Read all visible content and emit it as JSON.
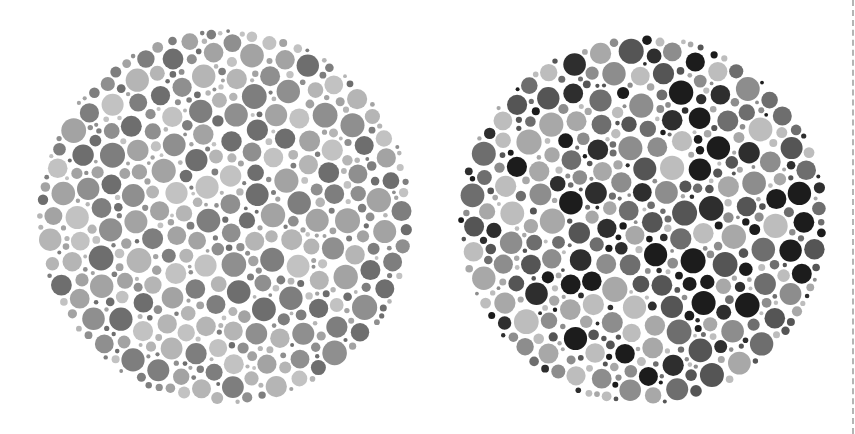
{
  "figure": {
    "background": "#ffffff",
    "divider": {
      "style": "dashed",
      "color": "#b4b4b4",
      "x": 852
    }
  },
  "plates": [
    {
      "name": "plate-left",
      "center": [
        225,
        217
      ],
      "radius": 188,
      "seed": 17,
      "palette": [
        "#6e6e6e",
        "#7e7e7e",
        "#8f8f8f",
        "#a3a3a3",
        "#b5b5b5",
        "#c2c2c2"
      ],
      "weights": [
        0.14,
        0.16,
        0.16,
        0.2,
        0.2,
        0.14
      ]
    },
    {
      "name": "plate-right",
      "center": [
        643,
        220
      ],
      "radius": 185,
      "seed": 91,
      "palette": [
        "#1c1c1c",
        "#2e2e2e",
        "#555555",
        "#6e6e6e",
        "#8d8d8d",
        "#a8a8a8",
        "#bdbdbd"
      ],
      "weights": [
        0.14,
        0.1,
        0.14,
        0.14,
        0.18,
        0.16,
        0.14
      ]
    }
  ]
}
